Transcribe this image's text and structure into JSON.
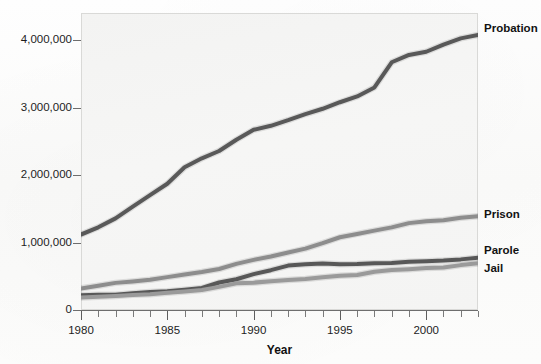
{
  "chart_data": {
    "type": "line",
    "title": "",
    "xlabel": "Year",
    "ylabel": "",
    "xlim": [
      1980,
      2003
    ],
    "ylim": [
      0,
      4400000
    ],
    "grid": false,
    "legend_position": "right-of-plot-at-line-end",
    "x_tick_labels": [
      "1980",
      "1985",
      "1990",
      "1995",
      "2000"
    ],
    "x_major_ticks": [
      1980,
      1985,
      1990,
      1995,
      2000
    ],
    "x_minor_tick_step": 1,
    "y_tick_labels": [
      "0",
      "1,000,000",
      "2,000,000",
      "3,000,000",
      "4,000,000"
    ],
    "y_ticks": [
      0,
      1000000,
      2000000,
      3000000,
      4000000
    ],
    "x": [
      1980,
      1981,
      1982,
      1983,
      1984,
      1985,
      1986,
      1987,
      1988,
      1989,
      1990,
      1991,
      1992,
      1993,
      1994,
      1995,
      1996,
      1997,
      1998,
      1999,
      2000,
      2001,
      2002,
      2003
    ],
    "series": [
      {
        "name": "Probation",
        "color": "#595959",
        "values": [
          1118000,
          1225000,
          1357000,
          1532000,
          1702000,
          1870000,
          2114000,
          2247000,
          2356000,
          2522000,
          2670000,
          2729000,
          2812000,
          2903000,
          2981000,
          3078000,
          3164000,
          3297000,
          3670000,
          3779000,
          3826000,
          3932000,
          4024000,
          4074000
        ]
      },
      {
        "name": "Prison",
        "color": "#8d8d8d",
        "values": [
          320000,
          360000,
          402000,
          423000,
          448000,
          487000,
          526000,
          562000,
          607000,
          683000,
          743000,
          792000,
          851000,
          909000,
          990000,
          1078000,
          1127000,
          1176000,
          1224000,
          1287000,
          1316000,
          1330000,
          1367000,
          1390000
        ]
      },
      {
        "name": "Parole",
        "color": "#585858",
        "values": [
          220000,
          226000,
          225000,
          247000,
          266000,
          277000,
          300000,
          326000,
          407000,
          456000,
          531000,
          590000,
          658000,
          676000,
          690000,
          679000,
          680000,
          694000,
          696000,
          715000,
          723000,
          732000,
          750000,
          774000
        ]
      },
      {
        "name": "Jail",
        "color": "#9a9a9a",
        "values": [
          184000,
          196000,
          209000,
          224000,
          234000,
          256000,
          274000,
          295000,
          343000,
          395000,
          405000,
          426000,
          444000,
          459000,
          486000,
          507000,
          518000,
          567000,
          592000,
          605000,
          621000,
          631000,
          665000,
          691000
        ]
      }
    ]
  },
  "axis": {
    "x_title": "Year"
  },
  "labels": {
    "probation": "Probation",
    "prison": "Prison",
    "parole": "Parole",
    "jail": "Jail"
  },
  "ghost": {
    "line1": "to Sentencing",
    "line2": "Hurdles"
  }
}
